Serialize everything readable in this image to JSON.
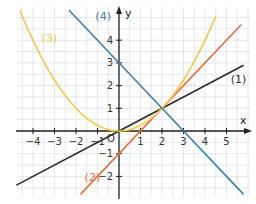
{
  "chart_data": {
    "type": "line",
    "title": "",
    "xlabel": "x",
    "ylabel": "y",
    "origin_label": "O",
    "xlim": [
      -4.75,
      5.8
    ],
    "ylim": [
      -2.9,
      5.5
    ],
    "grid": true,
    "grid_step": 0.5,
    "x_ticks": [
      -4,
      -3,
      -2,
      -1,
      1,
      2,
      3,
      4,
      5
    ],
    "y_ticks": [
      -2,
      -1,
      1,
      2,
      3,
      4
    ],
    "x_tick_labels": [
      "−4",
      "−3",
      "−2",
      "−1",
      "1",
      "2",
      "3",
      "4",
      "5"
    ],
    "y_tick_labels": [
      "−2",
      "−1",
      "1",
      "2",
      "3",
      "4"
    ],
    "series": [
      {
        "name": "(1)",
        "equation": "y = 0.5x",
        "kind": "linear",
        "a": 0,
        "m": 0.5,
        "b": 0,
        "x_range": [
          -4.75,
          5.77
        ],
        "color": "#2b2b2b",
        "label_pos": [
          5.2,
          2.1
        ]
      },
      {
        "name": "(2)",
        "equation": "y = x - 1",
        "kind": "linear",
        "a": 0,
        "m": 1,
        "b": -1,
        "x_range": [
          -1.77,
          5.67
        ],
        "color": "#e8703a",
        "label_pos": [
          -1.6,
          -2.2
        ]
      },
      {
        "name": "(3)",
        "equation": "y = 0.25x^2",
        "kind": "quadratic",
        "a": 0.25,
        "m": 0,
        "b": 0,
        "x_range": [
          -4.6,
          4.5
        ],
        "color": "#f5c84a",
        "label_pos": [
          -3.6,
          3.9
        ]
      },
      {
        "name": "(4)",
        "equation": "y = -x + 3",
        "kind": "linear",
        "a": 0,
        "m": -1,
        "b": 3,
        "x_range": [
          -2.3,
          5.77
        ],
        "color": "#3a7fb0",
        "label_pos": [
          -1.1,
          4.9
        ]
      }
    ],
    "intersection": [
      2,
      1
    ],
    "legend_position": "inline labels"
  },
  "colors": {
    "grid": "#d8dde6",
    "axis": "#222222"
  }
}
